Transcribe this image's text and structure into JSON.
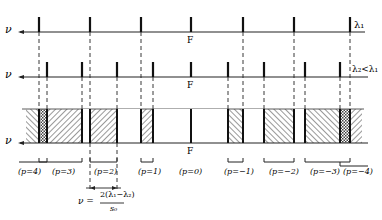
{
  "axes": [
    {
      "id": "top",
      "y": 32,
      "axis_label": "ν",
      "right_label": "λ₁",
      "center_label": "F"
    },
    {
      "id": "middle",
      "y": 77,
      "axis_label": "ν",
      "right_label": "λ₂<λ₁",
      "center_label": "F"
    },
    {
      "id": "bottom",
      "y": 143,
      "axis_label": "ν",
      "center_label": "F"
    }
  ],
  "orders": [
    {
      "label": "(p=4)",
      "x": 18
    },
    {
      "label": "(p=3)",
      "x": 62
    },
    {
      "label": "(p=2)",
      "x": 100
    },
    {
      "label": "(p=1)",
      "x": 150
    },
    {
      "label": "(p=0)",
      "x": 190
    },
    {
      "label": "(p=−1)",
      "x": 228
    },
    {
      "label": "(p=−2)",
      "x": 270
    },
    {
      "label": "(p=−3)",
      "x": 310
    },
    {
      "label": "(p=−4)",
      "x": 350
    }
  ],
  "width_formula": {
    "lhs": "ν =",
    "numerator": "2(λ₁−λ₂)",
    "denominator": "s₀"
  },
  "colors": {
    "ink": "#222222",
    "background": "#ffffff"
  }
}
